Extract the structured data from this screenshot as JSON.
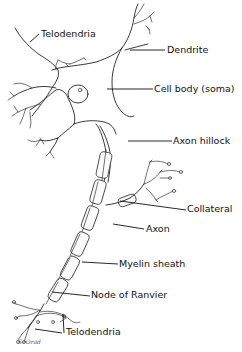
{
  "diagram": {
    "labels": {
      "telodendria_top": "Telodendria",
      "dendrite": "Dendrite",
      "cell_body": "Cell body (soma)",
      "axon_hillock": "Axon hillock",
      "collateral": "Collateral",
      "axon": "Axon",
      "myelin_sheath": "Myelin sheath",
      "node_of_ranvier": "Node of Ranvier",
      "telodendria_bottom": "Telodendria"
    },
    "signature": "S. Orad",
    "colors": {
      "line": "#222222",
      "background": "#ffffff",
      "text": "#111111"
    }
  }
}
